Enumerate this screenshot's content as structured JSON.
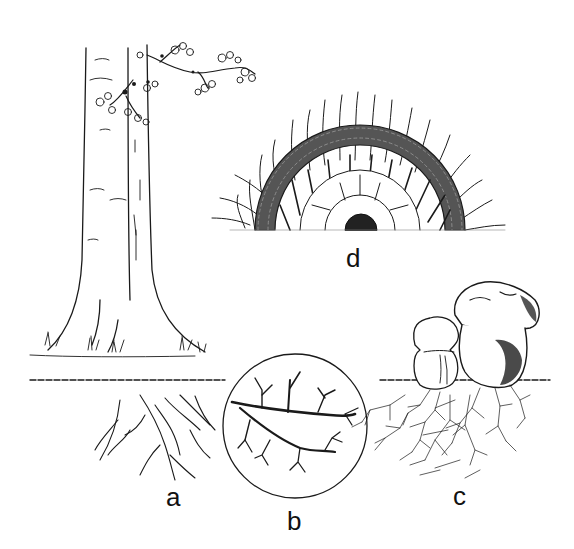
{
  "figure": {
    "panels": [
      {
        "id": "a",
        "label": "a",
        "depicts": "tree roots in soil"
      },
      {
        "id": "b",
        "label": "b",
        "depicts": "magnified short roots ensheathed by fungus"
      },
      {
        "id": "c",
        "label": "c",
        "depicts": "mushroom fruiting bodies with mycelium"
      },
      {
        "id": "d",
        "label": "d",
        "depicts": "cross-section of root with fungal mantle and Hartig net"
      }
    ]
  },
  "colors": {
    "ink": "#111111",
    "background": "#ffffff"
  }
}
